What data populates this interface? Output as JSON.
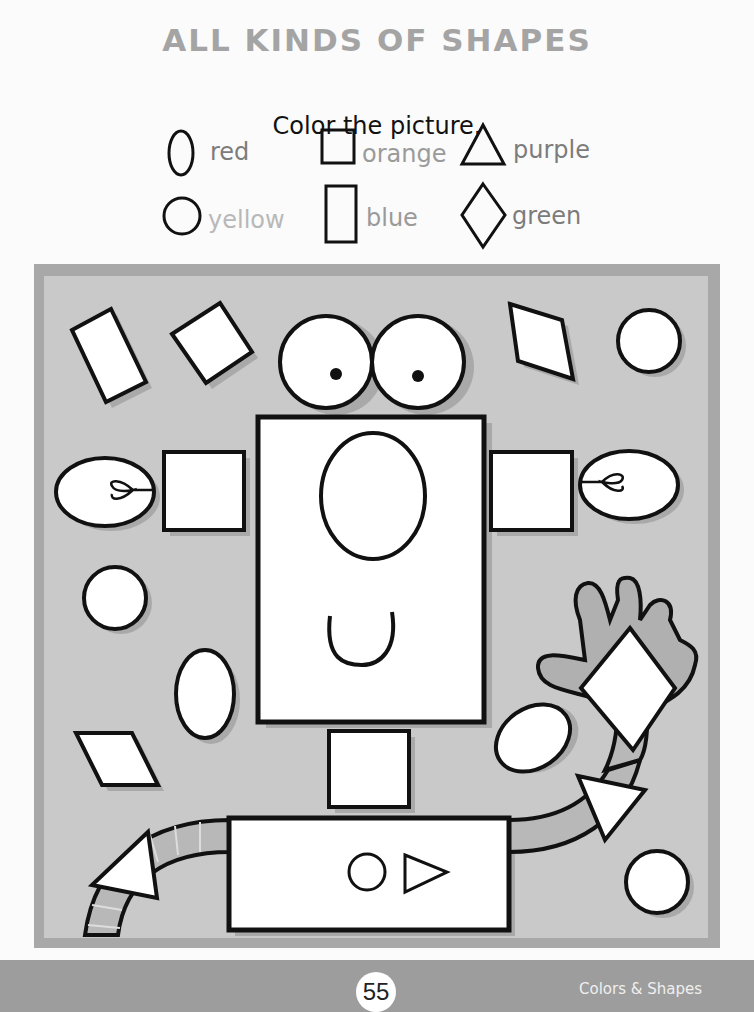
{
  "page": {
    "title": "ALL KINDS OF SHAPES",
    "instruction": "Color the picture."
  },
  "legend": [
    {
      "shape": "oval",
      "color_word": "red"
    },
    {
      "shape": "square",
      "color_word": "orange"
    },
    {
      "shape": "triangle",
      "color_word": "purple"
    },
    {
      "shape": "circle",
      "color_word": "yellow"
    },
    {
      "shape": "rectangle",
      "color_word": "blue"
    },
    {
      "shape": "diamond",
      "color_word": "green"
    }
  ],
  "picture": {
    "description": "Robot made of shapes to color",
    "frame_color": "#a8a8a8",
    "panel_color": "#c9c9c9"
  },
  "footer": {
    "page_number": "55",
    "section": "Colors & Shapes"
  }
}
